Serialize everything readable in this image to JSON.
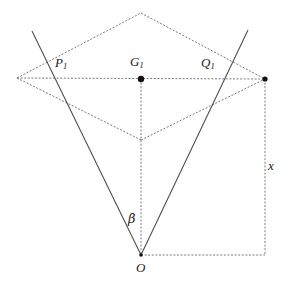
{
  "figure": {
    "width": 296,
    "height": 283,
    "background": "#ffffff",
    "stroke_color": "#4a4a4a",
    "dash_color": "#6b6b6b",
    "text_color": "#1a1a1a"
  },
  "labels": {
    "p1": {
      "base": "P",
      "sub": "1",
      "x": 55,
      "y": 56
    },
    "q1": {
      "base": "Q",
      "sub": "1",
      "x": 201,
      "y": 56
    },
    "g1": {
      "base": "G",
      "sub": "1",
      "x": 130,
      "y": 55
    },
    "o": {
      "base": "O",
      "sub": "",
      "x": 136,
      "y": 261
    },
    "beta": {
      "base": "β",
      "sub": "",
      "x": 128,
      "y": 212
    },
    "x": {
      "base": "x",
      "sub": "",
      "x": 268,
      "y": 159
    }
  },
  "points": {
    "apex_top": {
      "name": "top-vertex",
      "x": 141,
      "y": 13
    },
    "left_vertex": {
      "name": "left-vertex",
      "x": 17,
      "y": 78
    },
    "right_vertex": {
      "name": "right-vertex",
      "x": 265,
      "y": 79
    },
    "inner_bottom": {
      "name": "inner-bottom-vertex",
      "x": 141,
      "y": 140
    },
    "center_g1": {
      "name": "centroid-point",
      "x": 141,
      "y": 79
    },
    "origin_o": {
      "name": "origin-point",
      "x": 141,
      "y": 255
    },
    "corner_br": {
      "name": "bottom-right-corner",
      "x": 265,
      "y": 255
    },
    "ray_left_top": {
      "name": "left-ray-endpoint",
      "x": 32,
      "y": 31
    },
    "ray_right_top": {
      "name": "right-ray-endpoint",
      "x": 248,
      "y": 30
    }
  },
  "dotted_segments": [
    {
      "name": "horizontal-axis",
      "x1": 17,
      "y1": 78,
      "x2": 265,
      "y2": 79
    },
    {
      "name": "upper-left-edge",
      "x1": 17,
      "y1": 78,
      "x2": 141,
      "y2": 13
    },
    {
      "name": "upper-right-edge",
      "x1": 141,
      "y1": 13,
      "x2": 265,
      "y2": 79
    },
    {
      "name": "lower-left-edge",
      "x1": 17,
      "y1": 78,
      "x2": 141,
      "y2": 140
    },
    {
      "name": "lower-right-edge",
      "x1": 141,
      "y1": 140,
      "x2": 265,
      "y2": 79
    },
    {
      "name": "vertical-center-line",
      "x1": 141,
      "y1": 79,
      "x2": 141,
      "y2": 255
    },
    {
      "name": "right-vertical-line",
      "x1": 265,
      "y1": 79,
      "x2": 265,
      "y2": 255
    },
    {
      "name": "bottom-horizontal-line",
      "x1": 141,
      "y1": 255,
      "x2": 265,
      "y2": 255
    }
  ],
  "solid_segments": [
    {
      "name": "left-ray-from-origin",
      "x1": 141,
      "y1": 255,
      "x2": 32,
      "y2": 31
    },
    {
      "name": "right-ray-from-origin",
      "x1": 141,
      "y1": 255,
      "x2": 248,
      "y2": 30
    }
  ],
  "markers": [
    {
      "name": "centroid-dot",
      "x": 141,
      "y": 79,
      "r": 3.2
    },
    {
      "name": "right-vertex-dot",
      "x": 265,
      "y": 79,
      "r": 2.6
    },
    {
      "name": "origin-dot",
      "x": 141,
      "y": 255,
      "r": 1.8
    }
  ]
}
